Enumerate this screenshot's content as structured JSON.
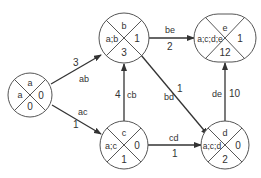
{
  "diagram": {
    "type": "network-graph",
    "nodes": [
      {
        "id": "a",
        "name": "a",
        "path": "a",
        "earliest": "0",
        "latest": "0"
      },
      {
        "id": "b",
        "name": "b",
        "path": "a;b",
        "earliest": "1",
        "latest": "3"
      },
      {
        "id": "c",
        "name": "c",
        "path": "a;c",
        "earliest": "0",
        "latest": "1"
      },
      {
        "id": "d",
        "name": "d",
        "path": "a;c;d",
        "earliest": "0",
        "latest": "2"
      },
      {
        "id": "e",
        "name": "e",
        "path": "a;c;d;e",
        "earliest": "1",
        "latest": "12"
      }
    ],
    "edges": [
      {
        "id": "ab",
        "from": "a",
        "to": "b",
        "label": "ab",
        "weight": "3"
      },
      {
        "id": "ac",
        "from": "a",
        "to": "c",
        "label": "ac",
        "weight": "1"
      },
      {
        "id": "cb",
        "from": "c",
        "to": "b",
        "label": "cb",
        "weight": "4"
      },
      {
        "id": "be",
        "from": "b",
        "to": "e",
        "label": "be",
        "weight": "2"
      },
      {
        "id": "bd",
        "from": "b",
        "to": "d",
        "label": "bd",
        "weight": "1"
      },
      {
        "id": "cd",
        "from": "c",
        "to": "d",
        "label": "cd",
        "weight": "1"
      },
      {
        "id": "de",
        "from": "d",
        "to": "e",
        "label": "de",
        "weight": "10"
      }
    ],
    "colors": {
      "stroke": "#333333",
      "fill": "#ffffff"
    }
  }
}
